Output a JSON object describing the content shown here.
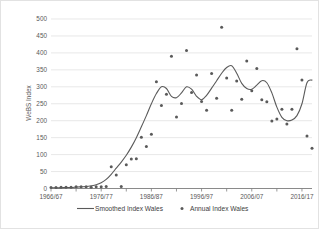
{
  "chart_data": {
    "type": "scatter",
    "title": "",
    "xlabel": "",
    "ylabel": "WeBS Index",
    "ylim": [
      0,
      500
    ],
    "ytick_values": [
      0,
      50,
      100,
      150,
      200,
      250,
      300,
      350,
      400,
      450,
      500
    ],
    "ytick_labels": [
      "0",
      "50",
      "100",
      "150",
      "200",
      "250",
      "300",
      "350",
      "400",
      "450",
      "500"
    ],
    "xlim": [
      1966,
      2018
    ],
    "xtick_labels": [
      "1966/67",
      "1976/77",
      "1986/87",
      "1996/97",
      "2006/07",
      "2016/17"
    ],
    "xtick_values": [
      1966,
      1976,
      1986,
      1996,
      2006,
      2016
    ],
    "xminor_step": 5,
    "grid": "horizontal",
    "legend_position": "bottom",
    "series": [
      {
        "name": "Smoothed Index Wales",
        "type": "line",
        "color": "#5a5a5a",
        "x": [
          1966,
          1967,
          1968,
          1969,
          1970,
          1971,
          1972,
          1973,
          1974,
          1975,
          1976,
          1977,
          1978,
          1979,
          1980,
          1981,
          1982,
          1983,
          1984,
          1985,
          1986,
          1987,
          1988,
          1989,
          1990,
          1991,
          1992,
          1993,
          1994,
          1995,
          1996,
          1997,
          1998,
          1999,
          2000,
          2001,
          2002,
          2003,
          2004,
          2005,
          2006,
          2007,
          2008,
          2009,
          2010,
          2011,
          2012,
          2013,
          2014,
          2015,
          2016,
          2017,
          2018
        ],
        "values": [
          2,
          2,
          2,
          3,
          3,
          4,
          5,
          6,
          8,
          11,
          17,
          27,
          42,
          60,
          78,
          98,
          122,
          150,
          182,
          215,
          250,
          280,
          300,
          295,
          272,
          268,
          282,
          300,
          293,
          272,
          262,
          275,
          296,
          318,
          340,
          357,
          362,
          340,
          310,
          295,
          293,
          305,
          318,
          312,
          282,
          240,
          210,
          200,
          202,
          215,
          250,
          312,
          320
        ]
      },
      {
        "name": "Annual Index Wales",
        "type": "scatter",
        "color": "#5a5a5a",
        "x": [
          1966,
          1967,
          1968,
          1969,
          1970,
          1971,
          1972,
          1973,
          1974,
          1975,
          1976,
          1977,
          1978,
          1979,
          1980,
          1981,
          1982,
          1983,
          1984,
          1985,
          1986,
          1987,
          1988,
          1989,
          1990,
          1991,
          1992,
          1993,
          1994,
          1995,
          1996,
          1997,
          1998,
          1999,
          2000,
          2001,
          2002,
          2003,
          2004,
          2005,
          2006,
          2007,
          2008,
          2009,
          2010,
          2011,
          2012,
          2013,
          2014,
          2015,
          2016,
          2017,
          2018
        ],
        "values": [
          3,
          3,
          4,
          4,
          4,
          5,
          5,
          5,
          4,
          5,
          5,
          6,
          64,
          40,
          6,
          70,
          87,
          88,
          151,
          124,
          160,
          315,
          245,
          278,
          390,
          211,
          251,
          407,
          283,
          335,
          257,
          231,
          339,
          266,
          476,
          326,
          231,
          317,
          263,
          376,
          288,
          354,
          262,
          256,
          199,
          205,
          234,
          190,
          234,
          412,
          320,
          155,
          119
        ]
      }
    ]
  },
  "legend": {
    "items": [
      {
        "label": "Smoothed Index Wales",
        "marker": "line"
      },
      {
        "label": "Annual Index Wales",
        "marker": "dot"
      }
    ]
  },
  "axes": {
    "y_title": "WeBS Index"
  },
  "colors": {
    "series": "#5a5a5a",
    "grid": "#d9d9d9",
    "axis": "#7f7f7f",
    "text": "#595959",
    "background": "#ffffff",
    "border": "#e2e2e2"
  }
}
